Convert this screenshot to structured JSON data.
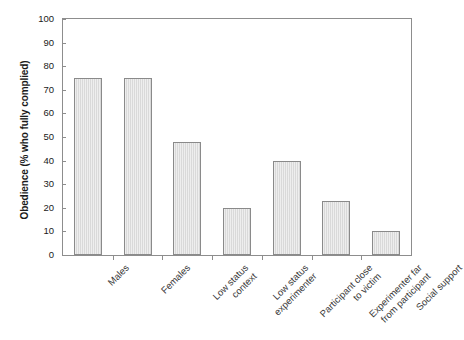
{
  "chart_data": {
    "type": "bar",
    "title": "",
    "xlabel": "",
    "ylabel": "Obedience (% who fully complied)",
    "ylim": [
      0,
      100
    ],
    "ytick_step": 10,
    "yticks": [
      100,
      90,
      80,
      70,
      60,
      50,
      40,
      30,
      20,
      10,
      0
    ],
    "grid": false,
    "legend": false,
    "categories": [
      "Males",
      "Females",
      "Low status context",
      "Low status experimenter",
      "Participant close to victim",
      "Experimenter far from participant",
      "Social support"
    ],
    "category_lines": [
      [
        "Males"
      ],
      [
        "Females"
      ],
      [
        "Low status",
        "context"
      ],
      [
        "Low status",
        "experimenter"
      ],
      [
        "Participant close",
        "to victim"
      ],
      [
        "Experimenter far",
        "from participant"
      ],
      [
        "Social support"
      ]
    ],
    "values": [
      75,
      75,
      48,
      20,
      40,
      23,
      10
    ],
    "colors": {
      "bar_fill": "#d9d9d9",
      "bar_border": "#8a8a8a",
      "axis": "#8d8d8d",
      "text": "#1a1a1a",
      "background": "#ffffff"
    }
  }
}
